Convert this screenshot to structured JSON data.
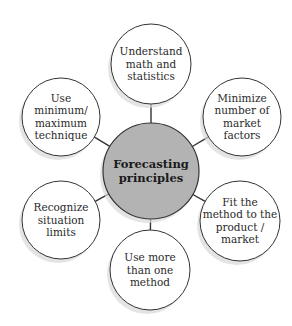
{
  "diagram": {
    "type": "hub-and-spoke",
    "center": {
      "lines": [
        "Forecasting",
        "principles"
      ],
      "fill": "#b3b3b3",
      "cx": 151,
      "cy": 171,
      "r": 48
    },
    "nodes": [
      {
        "id": "top",
        "lines": [
          "Understand",
          "math and",
          "statistics"
        ],
        "cx": 151,
        "cy": 64,
        "r": 40
      },
      {
        "id": "upper-right",
        "lines": [
          "Minimize",
          "number of",
          "market",
          "factors"
        ],
        "cx": 242,
        "cy": 117,
        "r": 39
      },
      {
        "id": "lower-right",
        "lines": [
          "Fit the",
          "method to the",
          "product /",
          "market"
        ],
        "cx": 240,
        "cy": 221,
        "r": 40
      },
      {
        "id": "bottom",
        "lines": [
          "Use more",
          "than one",
          "method"
        ],
        "cx": 150,
        "cy": 270,
        "r": 40
      },
      {
        "id": "lower-left",
        "lines": [
          "Recognize",
          "situation",
          "limits"
        ],
        "cx": 61,
        "cy": 220,
        "r": 39
      },
      {
        "id": "upper-left",
        "lines": [
          "Use",
          "minimum/",
          "maximum",
          "technique"
        ],
        "cx": 61,
        "cy": 117,
        "r": 39
      }
    ],
    "colors": {
      "node_fill": "#ffffff",
      "stroke": "#333333",
      "shadow": "#d9d9d9"
    }
  }
}
